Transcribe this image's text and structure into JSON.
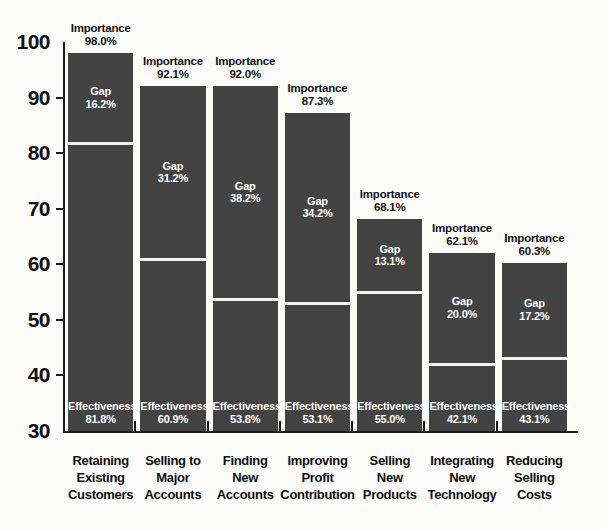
{
  "chart_data": {
    "type": "bar",
    "subtype": "stacked-bar",
    "title": "",
    "xlabel": "",
    "ylabel": "",
    "ylim": [
      30,
      100
    ],
    "ytick_labels": [
      "100",
      "90",
      "80",
      "70",
      "60",
      "50",
      "40",
      "30"
    ],
    "yticks": [
      100,
      90,
      80,
      70,
      60,
      50,
      40,
      30
    ],
    "grid": false,
    "legend": "none",
    "categories": [
      "Retaining Existing Customers",
      "Selling to Major Accounts",
      "Finding New Accounts",
      "Improving Profit Contribution",
      "Selling New Products",
      "Integrating New Technology",
      "Reducing Selling Costs"
    ],
    "series": [
      {
        "name": "Effectiveness",
        "values": [
          81.8,
          60.9,
          53.8,
          53.1,
          55.0,
          42.1,
          43.1
        ]
      },
      {
        "name": "Gap",
        "values": [
          16.2,
          31.2,
          38.2,
          34.2,
          13.1,
          20.0,
          17.2
        ]
      },
      {
        "name": "Importance",
        "values": [
          98.0,
          92.1,
          92.0,
          87.3,
          68.1,
          62.1,
          60.3
        ]
      }
    ],
    "bar_color": "#434343",
    "divider_color": "#f2f2f0",
    "text_on_bar_color": "#ffffff",
    "axis_color": "#1a1a1a",
    "background_color": "#fbfbfa"
  },
  "axis": {
    "ticks": [
      {
        "label": "100",
        "value": 100
      },
      {
        "label": "90",
        "value": 90
      },
      {
        "label": "80",
        "value": 80
      },
      {
        "label": "70",
        "value": 70
      },
      {
        "label": "60",
        "value": 60
      },
      {
        "label": "50",
        "value": 50
      },
      {
        "label": "40",
        "value": 40
      },
      {
        "label": "30",
        "value": 30
      }
    ]
  },
  "bars": [
    {
      "category_lines": [
        "Retaining",
        "Existing",
        "Customers"
      ],
      "importance_title": "Importance",
      "importance_value": "98.0%",
      "gap_title": "Gap",
      "gap_value": "16.2%",
      "effectiveness_title": "Effectiveness",
      "effectiveness_value": "81.8%",
      "importance_num": 98.0,
      "gap_num": 16.2,
      "effectiveness_num": 81.8
    },
    {
      "category_lines": [
        "Selling to",
        "Major",
        "Accounts"
      ],
      "importance_title": "Importance",
      "importance_value": "92.1%",
      "gap_title": "Gap",
      "gap_value": "31.2%",
      "effectiveness_title": "Effectiveness",
      "effectiveness_value": "60.9%",
      "importance_num": 92.1,
      "gap_num": 31.2,
      "effectiveness_num": 60.9
    },
    {
      "category_lines": [
        "Finding",
        "New",
        "Accounts"
      ],
      "importance_title": "Importance",
      "importance_value": "92.0%",
      "gap_title": "Gap",
      "gap_value": "38.2%",
      "effectiveness_title": "Effectiveness",
      "effectiveness_value": "53.8%",
      "importance_num": 92.0,
      "gap_num": 38.2,
      "effectiveness_num": 53.8
    },
    {
      "category_lines": [
        "Improving",
        "Profit",
        "Contribution"
      ],
      "importance_title": "Importance",
      "importance_value": "87.3%",
      "gap_title": "Gap",
      "gap_value": "34.2%",
      "effectiveness_title": "Effectiveness",
      "effectiveness_value": "53.1%",
      "importance_num": 87.3,
      "gap_num": 34.2,
      "effectiveness_num": 53.1
    },
    {
      "category_lines": [
        "Selling",
        "New",
        "Products"
      ],
      "importance_title": "Importance",
      "importance_value": "68.1%",
      "gap_title": "Gap",
      "gap_value": "13.1%",
      "effectiveness_title": "Effectiveness",
      "effectiveness_value": "55.0%",
      "importance_num": 68.1,
      "gap_num": 13.1,
      "effectiveness_num": 55.0
    },
    {
      "category_lines": [
        "Integrating",
        "New",
        "Technology"
      ],
      "importance_title": "Importance",
      "importance_value": "62.1%",
      "gap_title": "Gap",
      "gap_value": "20.0%",
      "effectiveness_title": "Effectiveness",
      "effectiveness_value": "42.1%",
      "importance_num": 62.1,
      "gap_num": 20.0,
      "effectiveness_num": 42.1
    },
    {
      "category_lines": [
        "Reducing",
        "Selling",
        "Costs"
      ],
      "importance_title": "Importance",
      "importance_value": "60.3%",
      "gap_title": "Gap",
      "gap_value": "17.2%",
      "effectiveness_title": "Effectiveness",
      "effectiveness_value": "43.1%",
      "importance_num": 60.3,
      "gap_num": 17.2,
      "effectiveness_num": 43.1
    }
  ]
}
